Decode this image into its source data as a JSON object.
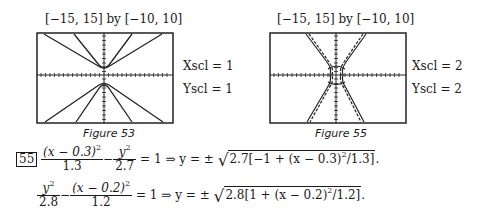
{
  "figures": [
    {
      "id": "figure-53",
      "window_label": "[−15, 15] by [−10, 10]",
      "xscl_label": "Xscl = 1",
      "yscl_label": "Yscl = 1",
      "caption": "Figure 53"
    },
    {
      "id": "figure-55",
      "window_label": "[−15, 15] by [−10, 10]",
      "xscl_label": "Xscl = 2",
      "yscl_label": "Yscl = 2",
      "caption": "Figure 55"
    }
  ],
  "problem": {
    "number": "55",
    "eq1": {
      "lhs_num1": "(x − 0.3)",
      "lhs_num1_exp": "2",
      "lhs_den1": "1.3",
      "minus": "−",
      "lhs_num2": "y",
      "lhs_num2_exp": "2",
      "lhs_den2": "2.7",
      "equals_implies": "= 1 ⇒ y = ±",
      "radicand": "2.7[−1 + (x − 0.3)",
      "radicand_exp": "2",
      "radicand_end": "/1.3]",
      "period": "."
    },
    "eq2": {
      "lhs_num1": "y",
      "lhs_num1_exp": "2",
      "lhs_den1": "2.8",
      "minus": "−",
      "lhs_num2": "(x − 0.2)",
      "lhs_num2_exp": "2",
      "lhs_den2": "1.2",
      "equals_implies": "= 1 ⇒ y = ±",
      "radicand": "2.8[1 + (x − 0.2)",
      "radicand_exp": "2",
      "radicand_end": "/1.2]",
      "period": "."
    }
  }
}
